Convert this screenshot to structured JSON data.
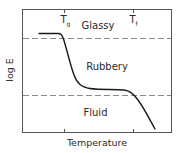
{
  "diagram": {
    "y_axis_label": "log E",
    "x_axis_label": "Temperature",
    "transitions": [
      {
        "symbol": "T",
        "subscript": "g",
        "meaning_position": "left tick"
      },
      {
        "symbol": "T",
        "subscript": "f",
        "meaning_position": "right tick"
      }
    ],
    "regions": {
      "glassy": "Glassy",
      "rubbery": "Rubbery",
      "fluid": "Fluid"
    },
    "colors": {
      "frame": "#555555",
      "dashed_lines": "#8a8a8a",
      "curve": "#1a1a1a",
      "text": "#2a2a2a",
      "background": "#ffffff"
    }
  }
}
